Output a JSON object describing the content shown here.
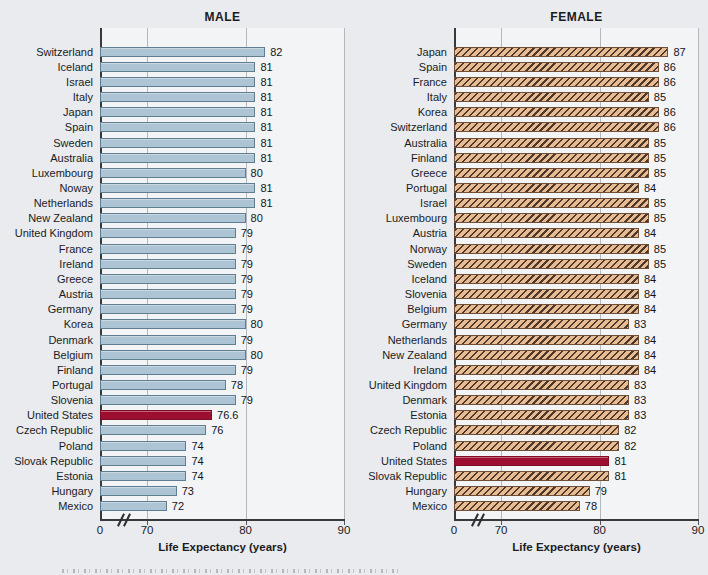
{
  "chart_data": [
    {
      "type": "bar",
      "orientation": "horizontal",
      "title": "MALE",
      "xlabel": "Life Expectancy (years)",
      "xlim": [
        0,
        90
      ],
      "ticks": [
        0,
        70,
        80,
        90
      ],
      "axis_break": {
        "between": [
          0,
          70
        ],
        "symbol": "//"
      },
      "grid": "vertical",
      "legend": "none",
      "categories": [
        "Switzerland",
        "Iceland",
        "Israel",
        "Italy",
        "Japan",
        "Spain",
        "Sweden",
        "Australia",
        "Luxembourg",
        "Noway",
        "Netherlands",
        "New Zealand",
        "United Kingdom",
        "France",
        "Ireland",
        "Greece",
        "Austria",
        "Germany",
        "Korea",
        "Denmark",
        "Belgium",
        "Finland",
        "Portugal",
        "Slovenia",
        "United States",
        "Czech Republic",
        "Poland",
        "Slovak Republic",
        "Estonia",
        "Hungary",
        "Mexico"
      ],
      "values": [
        82,
        81,
        81,
        81,
        81,
        81,
        81,
        81,
        80,
        81,
        81,
        80,
        79,
        79,
        79,
        79,
        79,
        79,
        80,
        79,
        80,
        79,
        78,
        79,
        76.6,
        76,
        74,
        74,
        74,
        73,
        72
      ],
      "value_labels": [
        "82",
        "81",
        "81",
        "81",
        "81",
        "81",
        "81",
        "81",
        "80",
        "81",
        "81",
        "80",
        "79",
        "79",
        "79",
        "79",
        "79",
        "79",
        "80",
        "79",
        "80",
        "79",
        "78",
        "79",
        "76.6",
        "76",
        "74",
        "74",
        "74",
        "73",
        "72"
      ],
      "highlight_category": "United States",
      "hatch": false,
      "colors": {
        "bar_fill": "#adc4d4",
        "bar_border": "#5f7e90",
        "highlight_fill": "#9c0f30",
        "highlight_border": "#7e0c26"
      }
    },
    {
      "type": "bar",
      "orientation": "horizontal",
      "title": "FEMALE",
      "xlabel": "Life Expectancy (years)",
      "xlim": [
        0,
        90
      ],
      "ticks": [
        0,
        70,
        80,
        90
      ],
      "axis_break": {
        "between": [
          0,
          70
        ],
        "symbol": "//"
      },
      "grid": "vertical",
      "legend": "none",
      "categories": [
        "Japan",
        "Spain",
        "France",
        "Italy",
        "Korea",
        "Switzerland",
        "Australia",
        "Finland",
        "Greece",
        "Portugal",
        "Israel",
        "Luxembourg",
        "Austria",
        "Norway",
        "Sweden",
        "Iceland",
        "Slovenia",
        "Belgium",
        "Germany",
        "Netherlands",
        "New Zealand",
        "Ireland",
        "United Kingdom",
        "Denmark",
        "Estonia",
        "Czech Republic",
        "Poland",
        "United States",
        "Slovak Republic",
        "Hungary",
        "Mexico"
      ],
      "values": [
        87,
        86,
        86,
        85,
        86,
        86,
        85,
        85,
        85,
        84,
        85,
        85,
        84,
        85,
        85,
        84,
        84,
        84,
        83,
        84,
        84,
        84,
        83,
        83,
        83,
        82,
        82,
        81,
        81,
        79,
        78
      ],
      "value_labels": [
        "87",
        "86",
        "86",
        "85",
        "86",
        "86",
        "85",
        "85",
        "85",
        "84",
        "85",
        "85",
        "84",
        "85",
        "85",
        "84",
        "84",
        "84",
        "83",
        "84",
        "84",
        "84",
        "83",
        "83",
        "83",
        "82",
        "82",
        "81",
        "81",
        "79",
        "78"
      ],
      "highlight_category": "United States",
      "hatch": true,
      "colors": {
        "bar_fill": "#e9bb92",
        "bar_border": "#6f4f38",
        "hatch_stripe": "#4d392c",
        "highlight_fill": "#9c0f30",
        "highlight_border": "#7e0c26"
      }
    }
  ]
}
